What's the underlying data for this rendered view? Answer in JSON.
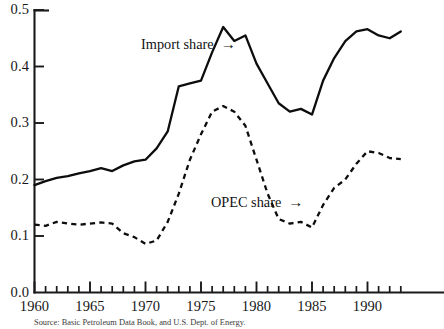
{
  "chart_data": {
    "type": "line",
    "title": "",
    "xlabel": "",
    "ylabel": "",
    "xlim": [
      1960,
      1993
    ],
    "ylim": [
      0.0,
      0.5
    ],
    "grid": false,
    "legend_position": "inline-annotations",
    "yticks": [
      "0.0",
      "0.1",
      "0.2",
      "0.3",
      "0.4",
      "0.5"
    ],
    "ytick_values": [
      0.0,
      0.1,
      0.2,
      0.3,
      0.4,
      0.5
    ],
    "xticks": [
      "1960",
      "1965",
      "1970",
      "1975",
      "1980",
      "1985",
      "1990"
    ],
    "xtick_values": [
      1960,
      1965,
      1970,
      1975,
      1980,
      1985,
      1990
    ],
    "x": [
      1960,
      1961,
      1962,
      1963,
      1964,
      1965,
      1966,
      1967,
      1968,
      1969,
      1970,
      1971,
      1972,
      1973,
      1974,
      1975,
      1976,
      1977,
      1978,
      1979,
      1980,
      1981,
      1982,
      1983,
      1984,
      1985,
      1986,
      1987,
      1988,
      1989,
      1990,
      1991,
      1992,
      1993
    ],
    "series": [
      {
        "name": "Import share",
        "style": "solid",
        "values": [
          0.19,
          0.197,
          0.203,
          0.206,
          0.211,
          0.215,
          0.22,
          0.215,
          0.225,
          0.232,
          0.235,
          0.255,
          0.285,
          0.365,
          0.37,
          0.375,
          0.425,
          0.47,
          0.445,
          0.455,
          0.405,
          0.37,
          0.335,
          0.32,
          0.325,
          0.315,
          0.375,
          0.415,
          0.445,
          0.462,
          0.466,
          0.455,
          0.45,
          0.462
        ]
      },
      {
        "name": "OPEC share",
        "style": "dashed",
        "values": [
          0.12,
          0.118,
          0.125,
          0.122,
          0.12,
          0.122,
          0.124,
          0.122,
          0.105,
          0.098,
          0.086,
          0.092,
          0.125,
          0.175,
          0.235,
          0.28,
          0.32,
          0.33,
          0.32,
          0.295,
          0.235,
          0.175,
          0.13,
          0.122,
          0.125,
          0.115,
          0.155,
          0.185,
          0.2,
          0.228,
          0.25,
          0.247,
          0.238,
          0.236
        ]
      }
    ],
    "annotations": [
      {
        "id": "import-share-label",
        "text": "Import share",
        "arrow": "→"
      },
      {
        "id": "opec-share-label",
        "text": "OPEC share",
        "arrow": "→"
      }
    ]
  },
  "source_note": "Source: Basic Petroleum Data Book, and U.S. Dept. of Energy."
}
